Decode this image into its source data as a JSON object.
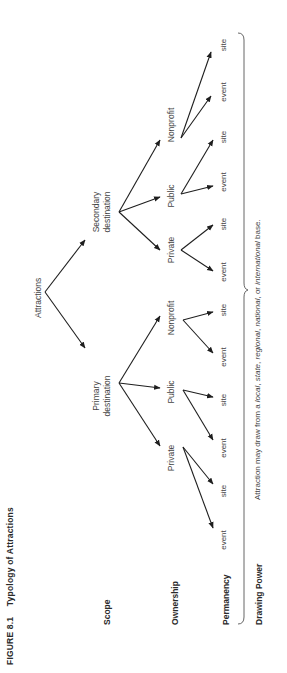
{
  "figure": {
    "label": "FIGURE 8.1",
    "title": "Typology of Attractions"
  },
  "rows": {
    "scope": "Scope",
    "ownership": "Ownership",
    "permanency": "Permanency",
    "drawing_power": "Drawing Power"
  },
  "tree": {
    "root": "Attractions",
    "primary": {
      "label_line1": "Primary",
      "label_line2": "destination",
      "ownership": [
        {
          "label": "Private",
          "leaves": [
            "event",
            "site"
          ]
        },
        {
          "label": "Public",
          "leaves": [
            "event",
            "site"
          ]
        },
        {
          "label": "Nonprofit",
          "leaves": [
            "event",
            "site"
          ]
        }
      ]
    },
    "secondary": {
      "label_line1": "Secondary",
      "label_line2": "destination",
      "ownership": [
        {
          "label": "Private",
          "leaves": [
            "event",
            "site"
          ]
        },
        {
          "label": "Public",
          "leaves": [
            "event",
            "site"
          ]
        },
        {
          "label": "Nonprofit",
          "leaves": [
            "event",
            "site"
          ]
        }
      ]
    }
  },
  "drawing_power_note": {
    "prefix": "Attraction may draw from a ",
    "local": "local",
    "sep1": ", ",
    "state": "state",
    "sep2": ", ",
    "regional": "regional",
    "sep3": ", ",
    "national": "national",
    "sep4": ", or ",
    "international": "international",
    "suffix": " base."
  }
}
